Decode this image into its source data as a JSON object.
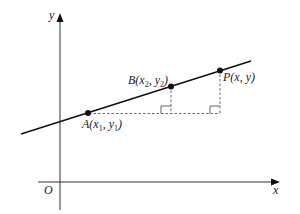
{
  "diagram": {
    "type": "coordinate-geometry",
    "axes": {
      "x_label": "x",
      "y_label": "y",
      "origin_label": "O"
    },
    "points": [
      {
        "id": "A",
        "label": "A(x",
        "sub1": "1",
        "mid": ", y",
        "sub2": "1",
        "end": ")"
      },
      {
        "id": "B",
        "label": "B(x",
        "sub1": "2",
        "mid": ", y",
        "sub2": "2",
        "end": ")"
      },
      {
        "id": "P",
        "label": "P(x, y)"
      }
    ],
    "colors": {
      "line": "#111111",
      "axis": "#333333",
      "dashed": "#555555",
      "background": "#ffffff"
    }
  }
}
